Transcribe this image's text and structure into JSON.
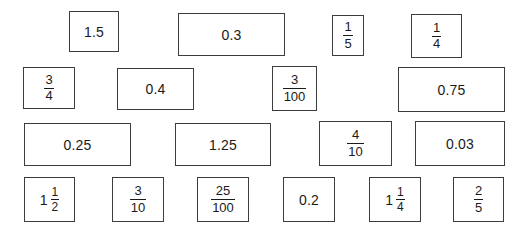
{
  "worksheet": {
    "title": "Fraction and decimal value cards",
    "background_color": "#ffffff",
    "card_border_color": "#3c3c3c",
    "card_fill_color": "#ffffff",
    "text_color": "#1a1a1a"
  },
  "cards": [
    {
      "id": "card-1",
      "row": 1,
      "type": "decimal",
      "text": "1.5",
      "whole": "",
      "numerator": "",
      "denominator": "",
      "x": 69,
      "y": 11,
      "w": 50,
      "h": 41
    },
    {
      "id": "card-2",
      "row": 1,
      "type": "decimal",
      "text": "0.3",
      "whole": "",
      "numerator": "",
      "denominator": "",
      "x": 178,
      "y": 13,
      "w": 107,
      "h": 43
    },
    {
      "id": "card-3",
      "row": 1,
      "type": "fraction",
      "text": "1/5",
      "whole": "",
      "numerator": "1",
      "denominator": "5",
      "x": 332,
      "y": 15,
      "w": 32,
      "h": 41
    },
    {
      "id": "card-4",
      "row": 1,
      "type": "fraction",
      "text": "1/4",
      "whole": "",
      "numerator": "1",
      "denominator": "4",
      "x": 411,
      "y": 14,
      "w": 51,
      "h": 44
    },
    {
      "id": "card-5",
      "row": 2,
      "type": "fraction",
      "text": "3/4",
      "whole": "",
      "numerator": "3",
      "denominator": "4",
      "x": 23,
      "y": 67,
      "w": 52,
      "h": 42
    },
    {
      "id": "card-6",
      "row": 2,
      "type": "decimal",
      "text": "0.4",
      "whole": "",
      "numerator": "",
      "denominator": "",
      "x": 117,
      "y": 68,
      "w": 77,
      "h": 42
    },
    {
      "id": "card-7",
      "row": 2,
      "type": "fraction",
      "text": "3/100",
      "whole": "",
      "numerator": "3",
      "denominator": "100",
      "x": 272,
      "y": 66,
      "w": 45,
      "h": 45
    },
    {
      "id": "card-8",
      "row": 2,
      "type": "decimal",
      "text": "0.75",
      "whole": "",
      "numerator": "",
      "denominator": "",
      "x": 398,
      "y": 67,
      "w": 107,
      "h": 45
    },
    {
      "id": "card-9",
      "row": 3,
      "type": "decimal",
      "text": "0.25",
      "whole": "",
      "numerator": "",
      "denominator": "",
      "x": 24,
      "y": 123,
      "w": 107,
      "h": 43
    },
    {
      "id": "card-10",
      "row": 3,
      "type": "decimal",
      "text": "1.25",
      "whole": "",
      "numerator": "",
      "denominator": "",
      "x": 175,
      "y": 123,
      "w": 96,
      "h": 43
    },
    {
      "id": "card-11",
      "row": 3,
      "type": "fraction",
      "text": "4/10",
      "whole": "",
      "numerator": "4",
      "denominator": "10",
      "x": 319,
      "y": 121,
      "w": 73,
      "h": 45
    },
    {
      "id": "card-12",
      "row": 3,
      "type": "decimal",
      "text": "0.03",
      "whole": "",
      "numerator": "",
      "denominator": "",
      "x": 415,
      "y": 121,
      "w": 90,
      "h": 45
    },
    {
      "id": "card-13",
      "row": 4,
      "type": "mixed",
      "text": "1 1/2",
      "whole": "1",
      "numerator": "1",
      "denominator": "2",
      "x": 24,
      "y": 177,
      "w": 51,
      "h": 45
    },
    {
      "id": "card-14",
      "row": 4,
      "type": "fraction",
      "text": "3/10",
      "whole": "",
      "numerator": "3",
      "denominator": "10",
      "x": 112,
      "y": 177,
      "w": 52,
      "h": 45
    },
    {
      "id": "card-15",
      "row": 4,
      "type": "fraction",
      "text": "25/100",
      "whole": "",
      "numerator": "25",
      "denominator": "100",
      "x": 197,
      "y": 177,
      "w": 52,
      "h": 45
    },
    {
      "id": "card-16",
      "row": 4,
      "type": "decimal",
      "text": "0.2",
      "whole": "",
      "numerator": "",
      "denominator": "",
      "x": 283,
      "y": 177,
      "w": 52,
      "h": 45
    },
    {
      "id": "card-17",
      "row": 4,
      "type": "mixed",
      "text": "1 1/4",
      "whole": "1",
      "numerator": "1",
      "denominator": "4",
      "x": 369,
      "y": 177,
      "w": 52,
      "h": 45
    },
    {
      "id": "card-18",
      "row": 4,
      "type": "fraction",
      "text": "2/5",
      "whole": "",
      "numerator": "2",
      "denominator": "5",
      "x": 453,
      "y": 177,
      "w": 51,
      "h": 45
    }
  ]
}
